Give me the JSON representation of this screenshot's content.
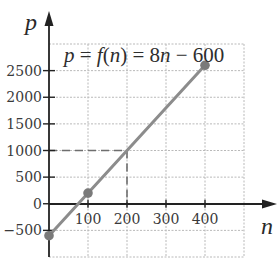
{
  "chart_data": {
    "type": "line",
    "title": "p = f(n) = 8n − 600",
    "title_segments": [
      {
        "text": "p",
        "italic": true
      },
      {
        "text": " = ",
        "italic": false
      },
      {
        "text": "f",
        "italic": true
      },
      {
        "text": "(",
        "italic": false
      },
      {
        "text": "n",
        "italic": true
      },
      {
        "text": ") = 8",
        "italic": false
      },
      {
        "text": "n",
        "italic": true
      },
      {
        "text": " − 600",
        "italic": false
      }
    ],
    "xlabel": "n",
    "ylabel": "p",
    "xlim": [
      0,
      500
    ],
    "ylim": [
      -1000,
      3000
    ],
    "grid": true,
    "x_grid": [
      100,
      200,
      300,
      400,
      500
    ],
    "y_grid": [
      -1000,
      -500,
      500,
      1000,
      1500,
      2000,
      2500,
      3000
    ],
    "x_ticks": [
      100,
      200,
      300,
      400
    ],
    "x_tick_labels": [
      "100",
      "200",
      "300",
      "400"
    ],
    "y_ticks": [
      2500,
      2000,
      1500,
      1000,
      500,
      0,
      -500
    ],
    "y_tick_labels": [
      "2500",
      "2000",
      "1500",
      "1000",
      "500",
      "0",
      "−500"
    ],
    "series": [
      {
        "name": "p = 8n − 600",
        "x": [
          0,
          400
        ],
        "y": [
          -600,
          2600
        ],
        "color": "#8c8c8c"
      }
    ],
    "points": [
      {
        "x": 0,
        "y": -600
      },
      {
        "x": 100,
        "y": 200
      },
      {
        "x": 400,
        "y": 2600
      }
    ],
    "annotations": [
      {
        "type": "dashed-guide",
        "x": 200,
        "y": 1000,
        "description": "dashed lines from (200,1000) to both axes"
      }
    ]
  }
}
